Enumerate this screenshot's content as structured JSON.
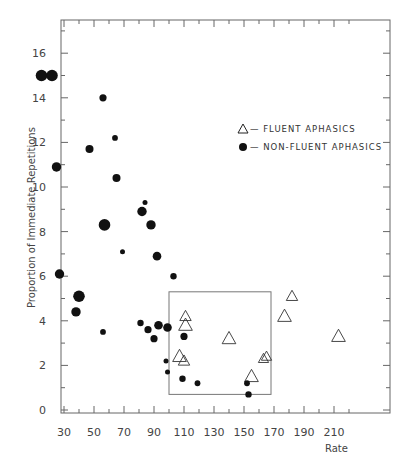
{
  "chart_data": {
    "type": "scatter",
    "title": "",
    "xlabel": "Rate",
    "ylabel": "Proportion of Immediate Repetitions",
    "xlim": [
      10,
      230
    ],
    "ylim": [
      0,
      17
    ],
    "x_ticks": [
      30,
      50,
      70,
      90,
      110,
      130,
      150,
      170,
      190,
      210
    ],
    "y_ticks": [
      0,
      2,
      4,
      6,
      8,
      10,
      12,
      14,
      16
    ],
    "grid": false,
    "legend_position": "upper right",
    "highlight_box": {
      "x0": 100,
      "x1": 168,
      "y0": 0.7,
      "y1": 5.3
    },
    "series": [
      {
        "name": "FLUENT APHASICS",
        "marker": "triangle-open",
        "points": [
          {
            "x": 107,
            "y": 2.4,
            "s": 1.2
          },
          {
            "x": 110,
            "y": 2.2,
            "s": 1.0
          },
          {
            "x": 111,
            "y": 4.2,
            "s": 1.0
          },
          {
            "x": 111,
            "y": 3.8,
            "s": 1.2
          },
          {
            "x": 140,
            "y": 3.2,
            "s": 1.2
          },
          {
            "x": 155,
            "y": 1.5,
            "s": 1.2
          },
          {
            "x": 163,
            "y": 2.3,
            "s": 0.9
          },
          {
            "x": 165,
            "y": 2.4,
            "s": 0.9
          },
          {
            "x": 177,
            "y": 4.2,
            "s": 1.2
          },
          {
            "x": 182,
            "y": 5.1,
            "s": 1.0
          },
          {
            "x": 213,
            "y": 3.3,
            "s": 1.2
          }
        ]
      },
      {
        "name": "NON-FLUENT APHASICS",
        "marker": "circle-filled",
        "points": [
          {
            "x": 15,
            "y": 15.0,
            "s": 1.6
          },
          {
            "x": 22,
            "y": 15.0,
            "s": 1.6
          },
          {
            "x": 25,
            "y": 10.9,
            "s": 1.3
          },
          {
            "x": 27,
            "y": 6.1,
            "s": 1.3
          },
          {
            "x": 38,
            "y": 4.4,
            "s": 1.3
          },
          {
            "x": 40,
            "y": 5.1,
            "s": 1.6
          },
          {
            "x": 47,
            "y": 11.7,
            "s": 1.1
          },
          {
            "x": 56,
            "y": 14.0,
            "s": 1.0
          },
          {
            "x": 56,
            "y": 3.5,
            "s": 0.8
          },
          {
            "x": 57,
            "y": 8.3,
            "s": 1.6
          },
          {
            "x": 64,
            "y": 12.2,
            "s": 0.8
          },
          {
            "x": 65,
            "y": 10.4,
            "s": 1.1
          },
          {
            "x": 69,
            "y": 7.1,
            "s": 0.7
          },
          {
            "x": 81,
            "y": 3.9,
            "s": 0.9
          },
          {
            "x": 82,
            "y": 8.9,
            "s": 1.3
          },
          {
            "x": 84,
            "y": 9.3,
            "s": 0.7
          },
          {
            "x": 86,
            "y": 3.6,
            "s": 1.0
          },
          {
            "x": 88,
            "y": 8.3,
            "s": 1.3
          },
          {
            "x": 90,
            "y": 3.2,
            "s": 1.0
          },
          {
            "x": 92,
            "y": 6.9,
            "s": 1.2
          },
          {
            "x": 93,
            "y": 3.8,
            "s": 1.2
          },
          {
            "x": 98,
            "y": 2.2,
            "s": 0.7
          },
          {
            "x": 99,
            "y": 1.7,
            "s": 0.7
          },
          {
            "x": 99,
            "y": 3.7,
            "s": 1.2
          },
          {
            "x": 103,
            "y": 6.0,
            "s": 0.9
          },
          {
            "x": 109,
            "y": 1.4,
            "s": 0.9
          },
          {
            "x": 110,
            "y": 3.3,
            "s": 1.0
          },
          {
            "x": 119,
            "y": 1.2,
            "s": 0.8
          },
          {
            "x": 152,
            "y": 1.2,
            "s": 0.8
          },
          {
            "x": 153,
            "y": 0.7,
            "s": 0.9
          }
        ]
      }
    ]
  },
  "legend": {
    "items": [
      {
        "symbol": "triangle-open",
        "label": "— FLUENT APHASICS"
      },
      {
        "symbol": "circle-filled",
        "label": "— NON-FLUENT APHASICS"
      }
    ]
  },
  "axes": {
    "x_title": "Rate",
    "y_title": "Proportion of Immediate Repetitions"
  }
}
